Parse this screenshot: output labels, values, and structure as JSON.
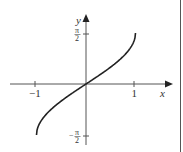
{
  "chart_data": {
    "type": "line",
    "title": "",
    "function": "y = arcsin(x)",
    "xlabel": "x",
    "ylabel": "y",
    "x_ticks": [
      "-1",
      "1"
    ],
    "y_ticks": [
      "π/2",
      "-π/2"
    ],
    "xlim": [
      -1.5,
      1.6
    ],
    "ylim": [
      -1.9,
      2.2
    ],
    "grid": false,
    "series": [
      {
        "name": "arcsin",
        "x": [
          -1,
          -0.95,
          -0.8,
          -0.6,
          -0.4,
          -0.2,
          0,
          0.2,
          0.4,
          0.6,
          0.8,
          0.95,
          1
        ],
        "y": [
          -1.571,
          -1.253,
          -0.927,
          -0.644,
          -0.412,
          -0.201,
          0,
          0.201,
          0.412,
          0.644,
          0.927,
          1.253,
          1.571
        ]
      }
    ]
  },
  "labels": {
    "x_axis": "x",
    "y_axis": "y",
    "x_tick_neg": "−1",
    "x_tick_pos": "1",
    "y_tick_top_num": "π",
    "y_tick_top_den": "2",
    "y_tick_bot_sign": "−",
    "y_tick_bot_num": "π",
    "y_tick_bot_den": "2"
  }
}
